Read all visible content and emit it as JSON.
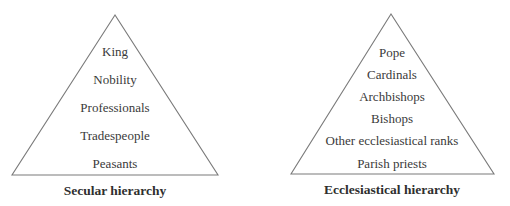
{
  "diagrams": [
    {
      "caption": "Secular hierarchy",
      "levels": [
        "King",
        "Nobility",
        "Professionals",
        "Tradespeople",
        "Peasants"
      ]
    },
    {
      "caption": "Ecclesiastical hierarchy",
      "levels": [
        "Pope",
        "Cardinals",
        "Archbishops",
        "Bishops",
        "Other ecclesiastical ranks",
        "Parish priests"
      ]
    }
  ],
  "colors": {
    "line": "#7a7a7a",
    "text": "#3a3a3a",
    "background": "#ffffff"
  }
}
